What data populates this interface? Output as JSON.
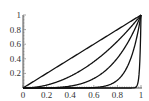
{
  "chart_data": {
    "type": "line",
    "title": "",
    "xlabel": "",
    "ylabel": "",
    "xlim": [
      0,
      1
    ],
    "ylim": [
      0,
      1
    ],
    "grid": false,
    "legend": null,
    "x_ticks": [
      "0",
      "0.2",
      "0.4",
      "0.6",
      "0.8",
      "1"
    ],
    "y_ticks": [
      "0.2",
      "0.4",
      "0.6",
      "0.8",
      "1"
    ],
    "series": [
      {
        "name": "y = x^1",
        "exponent": 1,
        "color": "#111111"
      },
      {
        "name": "y = x^2",
        "exponent": 2,
        "color": "#111111"
      },
      {
        "name": "y = x^4",
        "exponent": 4,
        "color": "#111111"
      },
      {
        "name": "y = x^10",
        "exponent": 10,
        "color": "#111111"
      },
      {
        "name": "y = x^100",
        "exponent": 100,
        "color": "#111111"
      }
    ],
    "sample_points": {
      "x": [
        0,
        0.2,
        0.4,
        0.6,
        0.8,
        0.9,
        0.95,
        1
      ],
      "y_x1": [
        0,
        0.2,
        0.4,
        0.6,
        0.8,
        0.9,
        0.95,
        1
      ],
      "y_x2": [
        0,
        0.04,
        0.16,
        0.36,
        0.64,
        0.81,
        0.9025,
        1
      ],
      "y_x4": [
        0,
        0.0016,
        0.0256,
        0.1296,
        0.4096,
        0.6561,
        0.8145,
        1
      ],
      "y_x10": [
        0,
        0,
        0.0001,
        0.006,
        0.107,
        0.349,
        0.599,
        1
      ],
      "y_x100": [
        0,
        0,
        0,
        0,
        0,
        0,
        0.006,
        1
      ]
    }
  }
}
